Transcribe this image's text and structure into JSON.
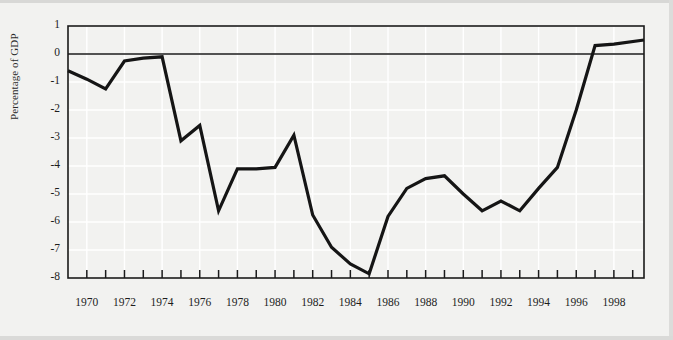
{
  "figure": {
    "background_color": "#f2f2f0",
    "line_color": "#151515",
    "frame_color": "#1a1a1a",
    "grid_color": "#ffffff",
    "zero_line_color": "#1a1a1a"
  },
  "chart_data": {
    "type": "line",
    "title": "",
    "xlabel": "",
    "ylabel": "Percentage of GDP",
    "xlim": [
      1969,
      1999.6
    ],
    "ylim": [
      -8,
      1
    ],
    "grid": true,
    "legend": null,
    "x_tick_labels": [
      "1970",
      "1972",
      "1974",
      "1976",
      "1978",
      "1980",
      "1982",
      "1984",
      "1986",
      "1988",
      "1990",
      "1992",
      "1994",
      "1996",
      "1998"
    ],
    "x_tick_values": [
      1970,
      1972,
      1974,
      1976,
      1978,
      1980,
      1982,
      1984,
      1986,
      1988,
      1990,
      1992,
      1994,
      1996,
      1998
    ],
    "x_minor_ticks": [
      1970,
      1971,
      1972,
      1973,
      1974,
      1975,
      1976,
      1977,
      1978,
      1979,
      1980,
      1981,
      1982,
      1983,
      1984,
      1985,
      1986,
      1987,
      1988,
      1989,
      1990,
      1991,
      1992,
      1993,
      1994,
      1995,
      1996,
      1997,
      1998,
      1999
    ],
    "y_tick_labels": [
      "1",
      "0",
      "-1",
      "-2",
      "-3",
      "-4",
      "-5",
      "-6",
      "-7",
      "-8"
    ],
    "y_tick_values": [
      1,
      0,
      -1,
      -2,
      -3,
      -4,
      -5,
      -6,
      -7,
      -8
    ],
    "x": [
      1969,
      1970,
      1971,
      1972,
      1973,
      1974,
      1975,
      1976,
      1977,
      1978,
      1979,
      1980,
      1981,
      1982,
      1983,
      1984,
      1985,
      1986,
      1987,
      1988,
      1989,
      1990,
      1991,
      1992,
      1993,
      1994,
      1995,
      1996,
      1997,
      1998,
      1999.6
    ],
    "values": [
      -0.6,
      -0.9,
      -1.25,
      -0.25,
      -0.15,
      -0.1,
      -3.1,
      -2.55,
      -5.6,
      -4.1,
      -4.1,
      -4.05,
      -2.9,
      -5.75,
      -6.9,
      -7.5,
      -7.85,
      -5.8,
      -4.8,
      -4.45,
      -4.35,
      -5.0,
      -5.6,
      -5.25,
      -5.6,
      -4.8,
      -4.05,
      -2.0,
      0.3,
      0.35,
      0.5
    ],
    "series_name": "Budget balance as percentage of GDP"
  }
}
